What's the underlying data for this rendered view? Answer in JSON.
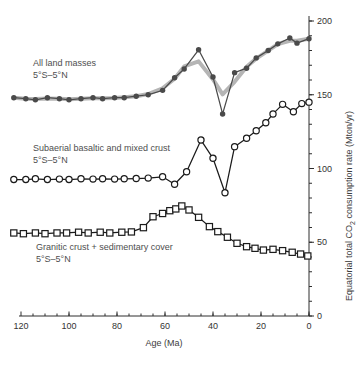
{
  "chart_data": {
    "type": "line",
    "title": "",
    "xlabel": "Age (Ma)",
    "ylabel_parts": [
      "Equatorial total CO",
      "2",
      " consumption rate (Mton/yr)"
    ],
    "x_axis": {
      "min": 0,
      "max": 124,
      "reversed": true,
      "major_ticks": [
        120,
        100,
        80,
        60,
        40,
        20,
        0
      ],
      "minor_step": 5
    },
    "y_axis": {
      "min": 0,
      "max": 200,
      "major_ticks": [
        0,
        50,
        100,
        150,
        200
      ],
      "minor_step": 10
    },
    "grid": false,
    "series": [
      {
        "id": "all-land-masses",
        "label": "All land masses",
        "sublabel": "5°S–5°N",
        "marker": "filled-circle",
        "color": "#4a4a4a",
        "smoothed_overlay": {
          "enabled": true,
          "color": "#b5b5b5",
          "width": 4
        },
        "ages": [
          123,
          118,
          114,
          109,
          104,
          100,
          95,
          90,
          86,
          81,
          77,
          72,
          67,
          61,
          56,
          52,
          46,
          40,
          36,
          31,
          26,
          22,
          17,
          13,
          8,
          5,
          0
        ],
        "values": [
          148,
          147.3,
          146.6,
          148,
          147.3,
          146.6,
          147.3,
          148,
          147.3,
          148,
          148,
          149,
          150,
          153,
          161.5,
          167.5,
          180.5,
          162,
          137,
          165,
          168,
          175,
          180,
          184.5,
          188.5,
          185,
          188
        ]
      },
      {
        "id": "subaerial-basaltic-and-mixed-crust",
        "label": "Subaerial basaltic and mixed crust",
        "sublabel": "5°S–5°N",
        "marker": "open-circle",
        "color": "#1b1b1b",
        "ages": [
          123,
          118,
          114,
          109,
          104,
          100,
          95,
          90,
          86,
          81,
          77,
          72,
          67,
          61,
          56,
          51,
          45,
          40,
          35,
          31,
          26,
          22,
          18,
          15,
          11,
          6.5,
          3,
          0
        ],
        "values": [
          92.5,
          92.5,
          93,
          92.5,
          92.8,
          92.5,
          93,
          92.8,
          93,
          92.8,
          93,
          93.2,
          93.5,
          94.4,
          89.3,
          97.8,
          119.3,
          106.9,
          83.6,
          114.8,
          120.5,
          125.6,
          131,
          137,
          143.5,
          138.5,
          144,
          145
        ]
      },
      {
        "id": "granitic-crust-plus-sedimentary-cover",
        "label": "Granitic crust + sedimentary cover",
        "sublabel": "5°S–5°N",
        "marker": "open-square",
        "color": "#1b1b1b",
        "ages": [
          123,
          119,
          114,
          110,
          105,
          101,
          96,
          92,
          87,
          83,
          78,
          74,
          69,
          65,
          61,
          58,
          55.5,
          53,
          50,
          46,
          41.5,
          38,
          34,
          30,
          26,
          22.5,
          19,
          15,
          11,
          7,
          3.5,
          0.5
        ],
        "values": [
          56.3,
          55.8,
          56.3,
          55.8,
          56.3,
          56.3,
          56.8,
          56.3,
          56.8,
          56.3,
          56.8,
          57,
          59.9,
          67.3,
          69.5,
          71.4,
          72.6,
          74.6,
          71.9,
          66.9,
          60.6,
          57.2,
          53.4,
          49.3,
          47,
          45.9,
          44.7,
          45.2,
          44.3,
          43.2,
          42,
          40.7
        ]
      }
    ]
  }
}
